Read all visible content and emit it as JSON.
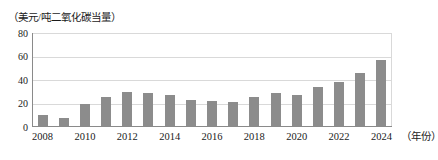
{
  "chart_data": {
    "type": "bar",
    "title": "",
    "subtitle": "",
    "xlabel": "（年份）",
    "ylabel": "（美元/吨二氧化碳当量）",
    "categories": [
      "2008",
      "2009",
      "2010",
      "2011",
      "2012",
      "2013",
      "2014",
      "2015",
      "2016",
      "2017",
      "2018",
      "2019",
      "2020",
      "2021",
      "2022",
      "2023",
      "2024"
    ],
    "values": [
      9,
      7,
      19,
      25,
      29,
      28,
      26,
      22,
      21,
      20.5,
      25,
      28,
      26,
      33.5,
      37.5,
      45,
      56
    ],
    "series": [
      {
        "name": "碳价",
        "values": [
          9,
          7,
          19,
          25,
          29,
          28,
          26,
          22,
          21,
          20.5,
          25,
          28,
          26,
          33.5,
          37.5,
          45,
          56
        ]
      }
    ],
    "ylim": [
      0,
      80
    ],
    "yticks": [
      0,
      20,
      40,
      60,
      80
    ],
    "ytick_labels": [
      "0",
      "20",
      "40",
      "60",
      "80"
    ],
    "xtick_labels": [
      "2008",
      "2010",
      "2012",
      "2014",
      "2016",
      "2018",
      "2020",
      "2022",
      "2024"
    ],
    "xtick_categories": [
      "2008",
      "2010",
      "2012",
      "2014",
      "2016",
      "2018",
      "2020",
      "2022",
      "2024"
    ],
    "grid": true,
    "grid_axis": "y",
    "legend": false,
    "legend_position": "none",
    "bar_color": "#8c8c8c",
    "gridline_color": "#d9d9d9",
    "axis_color": "#8a8a8a",
    "background_color": "#ffffff",
    "annotations": []
  }
}
